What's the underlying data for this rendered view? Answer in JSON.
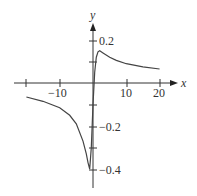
{
  "chart_data": {
    "type": "line",
    "title": "",
    "xlabel": "x",
    "ylabel": "y",
    "xlim": [
      -22,
      24
    ],
    "ylim": [
      -0.44,
      0.26
    ],
    "x_ticks": [
      -20,
      -10,
      0,
      10,
      20
    ],
    "x_tick_labels": [
      "-10",
      "10",
      "20"
    ],
    "y_ticks": [
      -0.4,
      -0.3,
      -0.2,
      -0.1,
      0.1,
      0.2
    ],
    "y_tick_labels": [
      "0.2",
      "−0.2",
      "−0.4"
    ],
    "grid": false,
    "legend": null,
    "series": [
      {
        "name": "f(x)",
        "x": [
          -20,
          -15,
          -10,
          -7,
          -5,
          -3,
          -2,
          -1.5,
          -1,
          -0.5,
          0,
          0.5,
          1,
          1.5,
          2,
          3,
          5,
          7,
          10,
          15,
          20
        ],
        "y": [
          -0.065,
          -0.085,
          -0.115,
          -0.15,
          -0.19,
          -0.27,
          -0.33,
          -0.37,
          -0.4,
          -0.3,
          -0.1,
          0.05,
          0.12,
          0.145,
          0.15,
          0.14,
          0.12,
          0.105,
          0.09,
          0.075,
          0.065
        ]
      }
    ]
  },
  "labels": {
    "x_axis": "x",
    "y_axis": "y",
    "x_tick_neg10": "−10",
    "x_tick_10": "10",
    "x_tick_20": "20",
    "y_tick_02": "0.2",
    "y_tick_neg02": "−0.2",
    "y_tick_neg04": "−0.4"
  }
}
